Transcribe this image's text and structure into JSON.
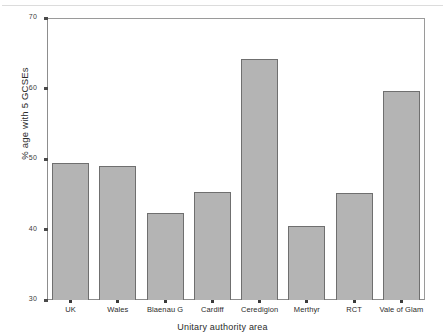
{
  "chart_data": {
    "type": "bar",
    "title": "",
    "subtitle": "",
    "xlabel": "Unitary authority area",
    "ylabel": "% age with 5 GCSEs",
    "categories": [
      "UK",
      "Wales",
      "Blaenau G",
      "Cardiff",
      "Ceredigion",
      "Merthyr",
      "RCT",
      "Vale of Glam"
    ],
    "values": [
      49.5,
      49.0,
      42.3,
      45.3,
      64.2,
      40.5,
      45.2,
      59.6
    ],
    "ylim": [
      30,
      70
    ],
    "yticks": [
      30,
      40,
      50,
      60,
      70
    ],
    "ytick_labels": [
      "30",
      "40",
      "50",
      "60",
      "70"
    ],
    "grid": false,
    "legend": null,
    "legend_position": "none",
    "bar_fill_color": "#b4b4b4",
    "bar_edge_color": "#6f6f6f",
    "axis_color": "#8d8d8d",
    "text_color": "#2b2b2b"
  }
}
